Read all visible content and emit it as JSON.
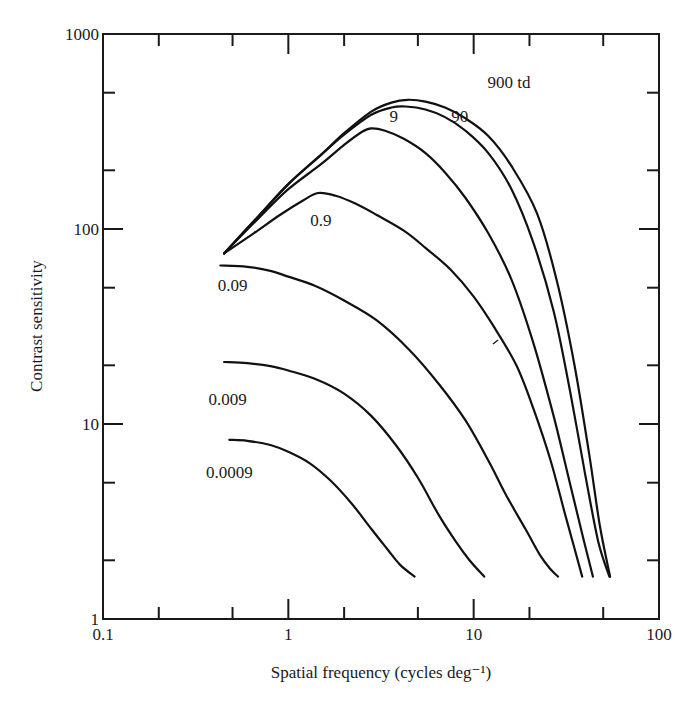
{
  "chart_data": {
    "type": "line",
    "title": "",
    "xlabel": "Spatial frequency (cycles deg⁻¹)",
    "ylabel": "Contrast sensitivity",
    "xscale": "log",
    "yscale": "log",
    "xlim": [
      0.1,
      100
    ],
    "ylim": [
      1,
      1000
    ],
    "x_ticks": [
      0.1,
      1,
      10,
      100
    ],
    "x_tick_labels": [
      "0.1",
      "1",
      "10",
      "100"
    ],
    "y_ticks": [
      1,
      10,
      100,
      1000
    ],
    "y_tick_labels": [
      "1",
      "10",
      "100",
      "1000"
    ],
    "minor_ticks": [
      2,
      5
    ],
    "grid": false,
    "legend": "none (curves labeled inline)",
    "series": [
      {
        "name": "900 td",
        "label": "900 td",
        "x": [
          0.45,
          0.7,
          1.0,
          1.5,
          2.0,
          2.8,
          3.6,
          4.4,
          5.5,
          7.0,
          9.0,
          12,
          16,
          22,
          28,
          35,
          42,
          48,
          54.5
        ],
        "y": [
          75,
          118,
          170,
          240,
          310,
          400,
          445,
          460,
          450,
          420,
          370,
          300,
          210,
          120,
          55,
          20,
          7,
          3,
          1.65
        ]
      },
      {
        "name": "90 td",
        "label": "90",
        "x": [
          0.45,
          0.7,
          1.0,
          1.5,
          2.0,
          2.8,
          3.6,
          4.3,
          5.5,
          7.0,
          9.0,
          12,
          16,
          21,
          27,
          33,
          40,
          47,
          54
        ],
        "y": [
          75,
          118,
          170,
          240,
          305,
          385,
          420,
          425,
          410,
          375,
          320,
          245,
          160,
          85,
          38,
          15,
          5.5,
          2.5,
          1.65
        ]
      },
      {
        "name": "9 td",
        "label": "9",
        "x": [
          0.45,
          0.7,
          1.0,
          1.5,
          2.0,
          2.5,
          2.8,
          3.3,
          4.2,
          5.5,
          7.0,
          9.0,
          12,
          16,
          21,
          27,
          33,
          39,
          44
        ],
        "y": [
          75,
          115,
          160,
          215,
          270,
          315,
          328,
          320,
          290,
          245,
          195,
          145,
          95,
          55,
          26,
          11,
          5,
          2.6,
          1.65
        ]
      },
      {
        "name": "0.9 td",
        "label": "0.9",
        "x": [
          0.45,
          0.65,
          0.9,
          1.2,
          1.45,
          1.8,
          2.3,
          3.0,
          4.2,
          5.5,
          7.5,
          10,
          13,
          17,
          21,
          26,
          31,
          35,
          38.5
        ],
        "y": [
          75,
          95,
          118,
          140,
          153,
          148,
          135,
          118,
          98,
          80,
          62,
          45,
          31,
          20,
          12,
          6.5,
          3.5,
          2.3,
          1.65
        ]
      },
      {
        "name": "0.09 td",
        "label": "0.09",
        "x": [
          0.43,
          0.6,
          0.8,
          1.0,
          1.4,
          2.0,
          3.0,
          4.5,
          6.5,
          9.0,
          12,
          15,
          19,
          23,
          26,
          28.5
        ],
        "y": [
          65,
          64,
          61,
          57,
          51,
          43,
          34,
          24,
          16,
          10.5,
          6.5,
          4.3,
          2.9,
          2.1,
          1.8,
          1.65
        ]
      },
      {
        "name": "0.009 td",
        "label": "0.009",
        "x": [
          0.45,
          0.6,
          0.8,
          1.0,
          1.4,
          2.0,
          2.8,
          3.8,
          5.0,
          6.5,
          8.0,
          9.5,
          11.4
        ],
        "y": [
          20.8,
          20.5,
          19.8,
          18.8,
          17,
          14.3,
          11,
          7.8,
          5.3,
          3.4,
          2.5,
          2.0,
          1.65
        ]
      },
      {
        "name": "0.0009 td",
        "label": "0.0009",
        "x": [
          0.48,
          0.6,
          0.8,
          1.0,
          1.3,
          1.7,
          2.2,
          2.8,
          3.4,
          4.0,
          4.8
        ],
        "y": [
          8.3,
          8.2,
          7.8,
          7.2,
          6.3,
          5.1,
          3.9,
          2.9,
          2.3,
          1.9,
          1.65
        ]
      }
    ],
    "annotations": [
      {
        "text": "900 td",
        "x": 15.5,
        "y": 530
      },
      {
        "text": "90",
        "x": 8.4,
        "y": 355
      },
      {
        "text": "9",
        "x": 3.7,
        "y": 355
      },
      {
        "text": "0.9",
        "x": 1.5,
        "y": 103
      },
      {
        "text": "0.09",
        "x": 0.5,
        "y": 48
      },
      {
        "text": "0.009",
        "x": 0.47,
        "y": 12.5
      },
      {
        "text": "0.0009",
        "x": 0.48,
        "y": 5.3
      }
    ]
  }
}
